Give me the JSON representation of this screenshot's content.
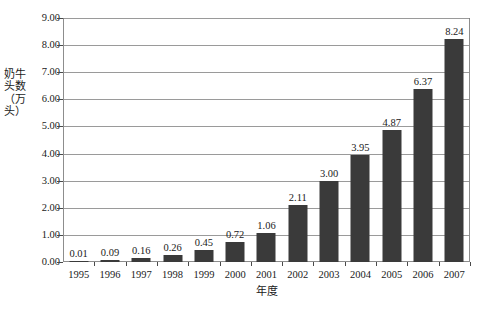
{
  "chart_data": {
    "type": "bar",
    "title": "",
    "xlabel": "年度",
    "ylabel": "奶牛头数（万头）",
    "categories": [
      "1995",
      "1996",
      "1997",
      "1998",
      "1999",
      "2000",
      "2001",
      "2002",
      "2003",
      "2004",
      "2005",
      "2006",
      "2007"
    ],
    "values": [
      0.01,
      0.09,
      0.16,
      0.26,
      0.45,
      0.72,
      1.06,
      2.11,
      3.0,
      3.95,
      4.87,
      6.37,
      8.24
    ],
    "value_labels": [
      "0.01",
      "0.09",
      "0.16",
      "0.26",
      "0.45",
      "0.72",
      "1.06",
      "2.11",
      "3.00",
      "3.95",
      "4.87",
      "6.37",
      "8.24"
    ],
    "ylim": [
      0.0,
      9.0
    ],
    "ytick_values": [
      0.0,
      1.0,
      2.0,
      3.0,
      4.0,
      5.0,
      6.0,
      7.0,
      8.0,
      9.0
    ],
    "ytick_labels": [
      "0.00",
      "1.00",
      "2.00",
      "3.00",
      "4.00",
      "5.00",
      "6.00",
      "7.00",
      "8.00",
      "9.00"
    ],
    "grid": true,
    "grid_axis": "y",
    "legend": false,
    "legend_position": "none",
    "bar_color": "#3a3a3a",
    "gridline_color": "#9a9a9a",
    "plot_border_color": "#8d8d8d",
    "background_color": "#ffffff",
    "text_color": "#1a1a1a",
    "data_labels_shown": true
  }
}
